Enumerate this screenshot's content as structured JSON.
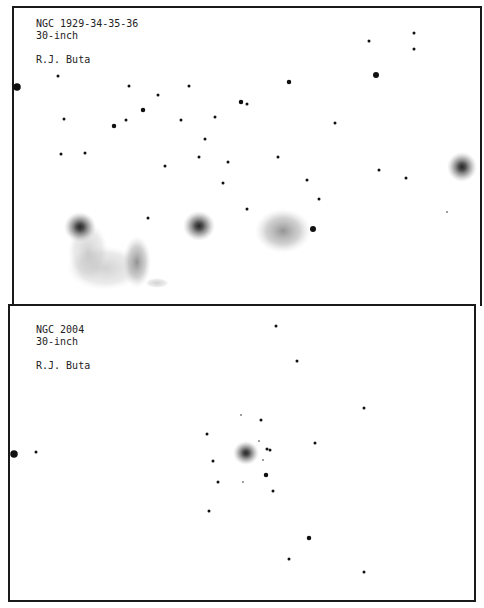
{
  "panels": [
    {
      "title": "NGC 1929-34-35-36",
      "telescope": "30-inch",
      "author": "R.J. Buta"
    },
    {
      "title": "NGC 2004",
      "telescope": "30-inch",
      "author": "R.J. Buta"
    }
  ],
  "colors": {
    "ink": "#111111",
    "paper": "#ffffff",
    "nebula": "#8a8a8a"
  },
  "stars_top": [
    [
      58,
      76,
      2
    ],
    [
      17,
      87,
      5
    ],
    [
      129,
      86,
      2
    ],
    [
      158,
      95,
      2
    ],
    [
      189,
      86,
      2
    ],
    [
      289,
      82,
      3
    ],
    [
      369,
      41,
      2
    ],
    [
      414,
      33,
      2
    ],
    [
      414,
      49,
      2
    ],
    [
      376,
      75,
      4
    ],
    [
      64,
      119,
      2
    ],
    [
      114,
      126,
      3
    ],
    [
      126,
      120,
      2
    ],
    [
      143,
      110,
      3
    ],
    [
      181,
      120,
      2
    ],
    [
      215,
      117,
      2
    ],
    [
      241,
      102,
      3
    ],
    [
      247,
      104,
      2
    ],
    [
      205,
      139,
      2
    ],
    [
      335,
      123,
      2
    ],
    [
      61,
      154,
      2
    ],
    [
      85,
      153,
      2
    ],
    [
      165,
      166,
      2
    ],
    [
      199,
      157,
      2
    ],
    [
      228,
      162,
      2
    ],
    [
      278,
      157,
      2
    ],
    [
      223,
      183,
      2
    ],
    [
      307,
      180,
      2
    ],
    [
      379,
      170,
      2
    ],
    [
      406,
      178,
      2
    ],
    [
      319,
      199,
      2
    ],
    [
      247,
      209,
      2
    ],
    [
      148,
      218,
      2
    ],
    [
      313,
      229,
      4
    ],
    [
      447,
      212,
      1
    ]
  ],
  "stars_bottom": [
    [
      276,
      326,
      2
    ],
    [
      297,
      361,
      2
    ],
    [
      364,
      408,
      2
    ],
    [
      241,
      415,
      1
    ],
    [
      261,
      420,
      2
    ],
    [
      207,
      434,
      2
    ],
    [
      259,
      441,
      1
    ],
    [
      267,
      449,
      2
    ],
    [
      270,
      450,
      2
    ],
    [
      315,
      443,
      2
    ],
    [
      14,
      454,
      5
    ],
    [
      36,
      452,
      2
    ],
    [
      213,
      461,
      2
    ],
    [
      263,
      460,
      1
    ],
    [
      266,
      475,
      3
    ],
    [
      218,
      482,
      2
    ],
    [
      243,
      482,
      1
    ],
    [
      273,
      491,
      2
    ],
    [
      209,
      511,
      2
    ],
    [
      309,
      538,
      3
    ],
    [
      289,
      559,
      2
    ],
    [
      364,
      572,
      2
    ]
  ]
}
